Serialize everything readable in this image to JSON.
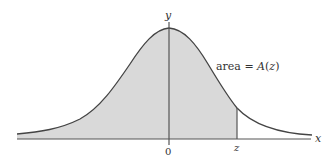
{
  "diagram": {
    "type": "normal-distribution-curve",
    "axis_labels": {
      "x": "x",
      "y": "y"
    },
    "tick_labels": {
      "origin": "0",
      "z": "z"
    },
    "annotation": {
      "prefix": "area = ",
      "func": "A",
      "arg": "z",
      "open": "(",
      "close": ")"
    },
    "colors": {
      "fill": "#d9d9d9",
      "stroke": "#444444",
      "axis": "#555555"
    }
  }
}
